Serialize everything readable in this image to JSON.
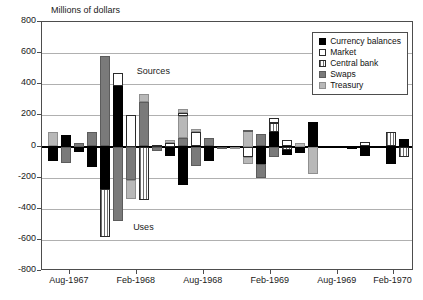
{
  "chart_data": {
    "type": "bar",
    "title": "",
    "ylabel": "Millions of dollars",
    "xlabel": "",
    "ylim": [
      -800,
      800
    ],
    "ytick_values": [
      800,
      600,
      400,
      200,
      0,
      -200,
      -400,
      -600,
      -800
    ],
    "ytick_labels": [
      "800",
      "600",
      "400",
      "200",
      "0",
      "-200",
      "-400",
      "-600",
      "-800"
    ],
    "grid": true,
    "legend_position": "top-right",
    "stacked": true,
    "annotations": [
      {
        "text": "Sources",
        "x_frac": 0.255,
        "y_value": 480
      },
      {
        "text": "Uses",
        "x_frac": 0.245,
        "y_value": -525
      }
    ],
    "xtick_labels": [
      "Aug-1967",
      "Feb-1968",
      "Aug-1968",
      "Feb-1969",
      "Aug-1969",
      "Feb-1970"
    ],
    "xtick_fracs": [
      0.075,
      0.255,
      0.435,
      0.615,
      0.795,
      0.945
    ],
    "series": [
      {
        "name": "Currency balances",
        "fill": "currency",
        "color": "#000000"
      },
      {
        "name": "Market",
        "fill": "market",
        "color": "#ffffff"
      },
      {
        "name": "Central bank",
        "fill": "centralbank",
        "color": "#ffffff"
      },
      {
        "name": "Swaps",
        "fill": "swaps",
        "color": "#7a7a7a"
      },
      {
        "name": "Treasury",
        "fill": "treasury",
        "color": "#b8b8b8"
      }
    ],
    "bars": [
      {
        "index": 0,
        "segments": [
          {
            "series": "treasury",
            "from": 0,
            "to": 90
          },
          {
            "series": "currency",
            "from": 0,
            "to": -95
          }
        ]
      },
      {
        "index": 1,
        "segments": [
          {
            "series": "currency",
            "from": 0,
            "to": 75
          },
          {
            "series": "swaps",
            "from": 0,
            "to": -105
          }
        ]
      },
      {
        "index": 2,
        "segments": [
          {
            "series": "swaps",
            "from": 0,
            "to": 25
          },
          {
            "series": "currency",
            "from": 0,
            "to": -35
          }
        ]
      },
      {
        "index": 3,
        "segments": [
          {
            "series": "swaps",
            "from": 0,
            "to": 90
          },
          {
            "series": "currency",
            "from": 0,
            "to": -130
          }
        ]
      },
      {
        "index": 4,
        "segments": [
          {
            "series": "swaps",
            "from": 0,
            "to": 580
          },
          {
            "series": "currency",
            "from": 0,
            "to": -275
          },
          {
            "series": "centralbank",
            "from": -275,
            "to": -580
          }
        ]
      },
      {
        "index": 5,
        "segments": [
          {
            "series": "currency",
            "from": 0,
            "to": 390
          },
          {
            "series": "market",
            "from": 390,
            "to": 470
          },
          {
            "series": "swaps",
            "from": 0,
            "to": -480
          }
        ]
      },
      {
        "index": 6,
        "segments": [
          {
            "series": "market",
            "from": 0,
            "to": 200
          },
          {
            "series": "swaps",
            "from": 0,
            "to": -215
          },
          {
            "series": "treasury",
            "from": -215,
            "to": -340
          }
        ]
      },
      {
        "index": 7,
        "segments": [
          {
            "series": "swaps",
            "from": 0,
            "to": 285
          },
          {
            "series": "treasury",
            "from": 285,
            "to": 340
          },
          {
            "series": "centralbank",
            "from": 0,
            "to": -345
          }
        ]
      },
      {
        "index": 8,
        "segments": [
          {
            "series": "centralbank",
            "from": 0,
            "to": 10
          },
          {
            "series": "swaps",
            "from": 0,
            "to": -30
          }
        ]
      },
      {
        "index": 9,
        "segments": [
          {
            "series": "market",
            "from": 0,
            "to": 25
          },
          {
            "series": "treasury",
            "from": 25,
            "to": 40
          },
          {
            "series": "currency",
            "from": 0,
            "to": -60
          }
        ]
      },
      {
        "index": 10,
        "segments": [
          {
            "series": "swaps",
            "from": 0,
            "to": 55
          },
          {
            "series": "treasury",
            "from": 55,
            "to": 195
          },
          {
            "series": "market",
            "from": 195,
            "to": 215
          },
          {
            "series": "treasury",
            "from": 215,
            "to": 240
          },
          {
            "series": "currency",
            "from": 0,
            "to": -245
          }
        ]
      },
      {
        "index": 11,
        "segments": [
          {
            "series": "market",
            "from": 0,
            "to": 95
          },
          {
            "series": "treasury",
            "from": 95,
            "to": 110
          },
          {
            "series": "swaps",
            "from": 0,
            "to": -125
          }
        ]
      },
      {
        "index": 12,
        "segments": [
          {
            "series": "swaps",
            "from": 0,
            "to": 55
          },
          {
            "series": "currency",
            "from": 0,
            "to": -95
          }
        ]
      },
      {
        "index": 13,
        "segments": [
          {
            "series": "currency",
            "from": 0,
            "to": 5
          },
          {
            "series": "swaps",
            "from": 0,
            "to": -8
          }
        ]
      },
      {
        "index": 14,
        "segments": [
          {
            "series": "currency",
            "from": 0,
            "to": 5
          },
          {
            "series": "treasury",
            "from": 0,
            "to": -10
          }
        ]
      },
      {
        "index": 15,
        "segments": [
          {
            "series": "treasury",
            "from": 0,
            "to": 100
          },
          {
            "series": "swaps",
            "from": 100,
            "to": 105
          },
          {
            "series": "market",
            "from": 0,
            "to": -70
          },
          {
            "series": "treasury",
            "from": -70,
            "to": -110
          }
        ]
      },
      {
        "index": 16,
        "segments": [
          {
            "series": "swaps",
            "from": 0,
            "to": 80
          },
          {
            "series": "currency",
            "from": 0,
            "to": -110
          },
          {
            "series": "swaps",
            "from": -110,
            "to": -200
          }
        ]
      },
      {
        "index": 17,
        "segments": [
          {
            "series": "currency",
            "from": 0,
            "to": 95
          },
          {
            "series": "centralbank",
            "from": 95,
            "to": 150
          },
          {
            "series": "market",
            "from": 150,
            "to": 180
          },
          {
            "series": "swaps",
            "from": 0,
            "to": -65
          }
        ]
      },
      {
        "index": 18,
        "segments": [
          {
            "series": "market",
            "from": 0,
            "to": 40
          },
          {
            "series": "centralbank",
            "from": 0,
            "to": -20
          },
          {
            "series": "currency",
            "from": -20,
            "to": -55
          }
        ]
      },
      {
        "index": 19,
        "segments": [
          {
            "series": "treasury",
            "from": 0,
            "to": 25
          },
          {
            "series": "currency",
            "from": 0,
            "to": -40
          }
        ]
      },
      {
        "index": 20,
        "segments": [
          {
            "series": "currency",
            "from": 0,
            "to": 160
          },
          {
            "series": "treasury",
            "from": 0,
            "to": -175
          }
        ]
      },
      {
        "index": 21,
        "segments": []
      },
      {
        "index": 22,
        "segments": []
      },
      {
        "index": 23,
        "segments": [
          {
            "series": "currency",
            "from": 0,
            "to": 3
          },
          {
            "series": "currency",
            "from": 0,
            "to": -5
          }
        ]
      },
      {
        "index": 24,
        "segments": [
          {
            "series": "market",
            "from": 0,
            "to": 30
          },
          {
            "series": "currency",
            "from": 0,
            "to": -60
          }
        ]
      },
      {
        "index": 25,
        "segments": []
      },
      {
        "index": 26,
        "segments": [
          {
            "series": "centralbank",
            "from": 0,
            "to": 90
          },
          {
            "series": "currency",
            "from": 0,
            "to": -115
          }
        ]
      },
      {
        "index": 27,
        "segments": [
          {
            "series": "currency",
            "from": 0,
            "to": 50
          },
          {
            "series": "centralbank",
            "from": 0,
            "to": -70
          }
        ]
      }
    ]
  },
  "legend": {
    "items": [
      {
        "label": "Currency balances",
        "fill": "currency"
      },
      {
        "label": "Market",
        "fill": "market"
      },
      {
        "label": "Central bank",
        "fill": "centralbank"
      },
      {
        "label": "Swaps",
        "fill": "swaps"
      },
      {
        "label": "Treasury",
        "fill": "treasury"
      }
    ]
  }
}
